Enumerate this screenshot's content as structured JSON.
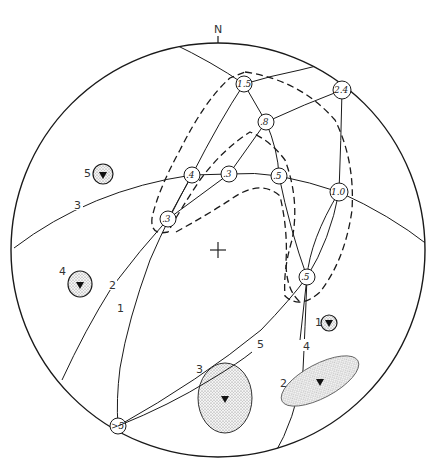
{
  "diagram": {
    "type": "stereonet",
    "north_label": "N",
    "center_marker": "cross",
    "primitive_circle": {
      "cx": 218,
      "cy": 250,
      "r": 207
    },
    "great_circles": [
      {
        "id": "1",
        "label": "1",
        "label_pos": [
          120,
          310
        ]
      },
      {
        "id": "2",
        "label": "2",
        "label_pos": [
          112,
          287
        ]
      },
      {
        "id": "3",
        "label": "3",
        "label_pos": [
          78,
          206
        ]
      },
      {
        "id": "4",
        "label": "4",
        "label_pos": [
          306,
          347
        ]
      },
      {
        "id": "5",
        "label": "5",
        "label_pos": [
          261,
          345
        ]
      }
    ],
    "intersection_nodes": [
      {
        "value": "1.5",
        "x": 244,
        "y": 84
      },
      {
        "value": ".8",
        "x": 266,
        "y": 122
      },
      {
        "value": "2.4",
        "x": 342,
        "y": 90
      },
      {
        "value": ".4",
        "x": 192,
        "y": 175
      },
      {
        "value": ".3",
        "x": 229,
        "y": 174
      },
      {
        "value": ".5",
        "x": 279,
        "y": 176
      },
      {
        "value": "1.0",
        "x": 339,
        "y": 192
      },
      {
        "value": ".3",
        "x": 168,
        "y": 219
      },
      {
        "value": ".5",
        "x": 307,
        "y": 277
      },
      {
        "value": ">5",
        "x": 118,
        "y": 426
      }
    ],
    "confidence_regions": [
      {
        "id": "1",
        "label": "1",
        "label_pos": [
          318,
          320
        ],
        "cx": 329,
        "cy": 323,
        "rx": 8,
        "ry": 8,
        "rotate": 0
      },
      {
        "id": "2",
        "label": "2",
        "label_pos": [
          281,
          383
        ],
        "cx": 320,
        "cy": 381,
        "rx": 43,
        "ry": 19,
        "rotate": -28
      },
      {
        "id": "3",
        "label": "3",
        "label_pos": [
          197,
          370
        ],
        "cx": 225,
        "cy": 398,
        "rx": 27,
        "ry": 35,
        "rotate": 0
      },
      {
        "id": "4",
        "label": "4",
        "label_pos": [
          60,
          272
        ],
        "cx": 80,
        "cy": 284,
        "rx": 12,
        "ry": 13,
        "rotate": 0
      },
      {
        "id": "5",
        "label": "5",
        "label_pos": [
          86,
          173
        ],
        "cx": 103,
        "cy": 174,
        "rx": 10,
        "ry": 10,
        "rotate": 0
      }
    ],
    "colors": {
      "line": "#1a1a1a",
      "stipple": "#999999",
      "background": "#ffffff"
    }
  }
}
